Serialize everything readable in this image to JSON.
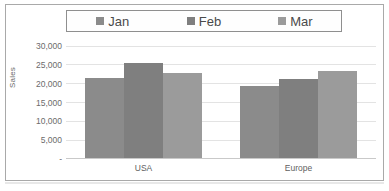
{
  "chart_data": {
    "type": "bar",
    "title": "",
    "subtitle": "",
    "xlabel": "",
    "ylabel": "Sales",
    "categories": [
      "USA",
      "Europe"
    ],
    "series": [
      {
        "name": "Jan",
        "values": [
          21300,
          19000
        ],
        "color": "#8b8b8b"
      },
      {
        "name": "Feb",
        "values": [
          25200,
          21100
        ],
        "color": "#7f7f7f"
      },
      {
        "name": "Mar",
        "values": [
          22700,
          23200
        ],
        "color": "#9b9b9b"
      }
    ],
    "ylim": [
      0,
      30000
    ],
    "ytick_labels": [
      "30,000",
      "25,000",
      "20,000",
      "15,000",
      "10,000",
      "5,000",
      "-"
    ],
    "ytick_values": [
      30000,
      25000,
      20000,
      15000,
      10000,
      5000,
      0
    ],
    "grid": true,
    "legend_position": "top",
    "bar_grouping": "clustered"
  },
  "legend": {
    "items": [
      {
        "label": "Jan",
        "swatch_icon": "square-swatch-icon",
        "color": "#8b8b8b"
      },
      {
        "label": "Feb",
        "swatch_icon": "square-swatch-icon",
        "color": "#7f7f7f"
      },
      {
        "label": "Mar",
        "swatch_icon": "square-swatch-icon",
        "color": "#9b9b9b"
      }
    ]
  },
  "colors": {
    "frame_border": "#a9a9a9",
    "gridline": "#e3e3e3",
    "axis_line": "#c9c9c9",
    "tick_text": "#6b6b6b",
    "legend_text": "#4a4a4a",
    "background": "#ffffff"
  }
}
